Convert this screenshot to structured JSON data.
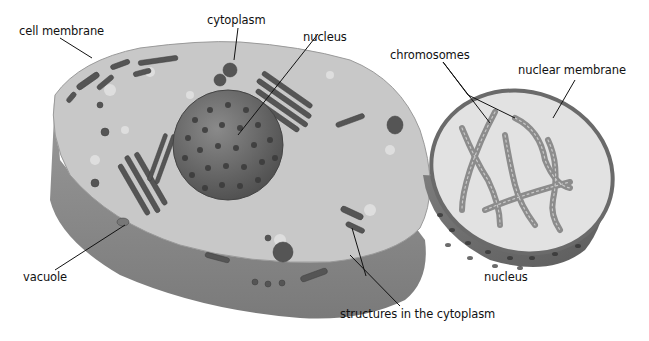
{
  "colors": {
    "background": "#ffffff",
    "cytoplasm_top": "#c9c9c9",
    "cell_side": "#8e8e8e",
    "organelle": "#5a5a5a",
    "nucleus": "#6e6e6e",
    "nucleus_interior": "#e6e6e6",
    "chromosome": "#8a8a8a",
    "leader_line": "#111111"
  },
  "labels": {
    "cell_membrane": "cell membrane",
    "cytoplasm": "cytoplasm",
    "nucleus_cell": "nucleus",
    "chromosomes": "chromosomes",
    "nuclear_membrane": "nuclear membrane",
    "vacuole": "vacuole",
    "structures": "structures in the cytoplasm",
    "nucleus_detail": "nucleus"
  }
}
